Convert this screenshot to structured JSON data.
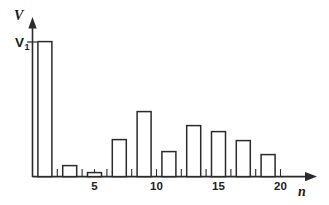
{
  "chart_data": {
    "type": "bar",
    "title": "",
    "subtitle": "",
    "xlabel": "n",
    "ylabel": "V",
    "x": [
      1,
      3,
      5,
      7,
      9,
      11,
      13,
      15,
      17,
      19
    ],
    "values": [
      1.0,
      0.081,
      0.03,
      0.274,
      0.481,
      0.185,
      0.378,
      0.333,
      0.267,
      0.163
    ],
    "categories": [
      "1",
      "3",
      "5",
      "7",
      "9",
      "11",
      "13",
      "15",
      "17",
      "19"
    ],
    "bar_pixel_heights": [
      135,
      11,
      4,
      37,
      65,
      25,
      51,
      45,
      36,
      22
    ],
    "xlim": [
      0,
      22.8
    ],
    "ylim": [
      0,
      1.13
    ],
    "xtick_values": [
      1,
      2,
      3,
      4,
      5,
      6,
      7,
      8,
      9,
      10,
      11,
      12,
      13,
      14,
      15,
      16,
      17,
      18,
      19,
      20
    ],
    "xtick_labeled": [
      5,
      10,
      15,
      20
    ],
    "xtick_labels": [
      "5",
      "10",
      "15",
      "20"
    ],
    "ytick_labels": [
      "V1"
    ],
    "grid": false,
    "legend": null,
    "annotations": [
      {
        "name": "v1-reference-line",
        "label": "V1",
        "label_main": "V",
        "label_sub": "1",
        "y_value": 1.0,
        "description": "horizontal reference tick marking the amplitude of the fundamental"
      }
    ],
    "axis_style": "arrow-terminated",
    "bar_fill": "#ffffff",
    "bar_stroke": "#2b2b2b",
    "axis_color": "#2b2b2b",
    "background": "#ffffff"
  },
  "axes": {
    "y_title": "V",
    "x_title": "n"
  },
  "ticks": {
    "labels": [
      "5",
      "10",
      "15",
      "20"
    ]
  },
  "reference": {
    "main": "V",
    "sub": "1"
  }
}
